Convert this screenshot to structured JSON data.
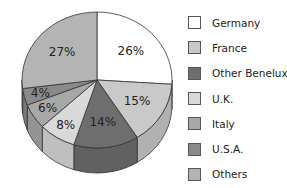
{
  "chart_data": {
    "type": "pie",
    "style": "3d",
    "title": "",
    "categories": [
      "Germany",
      "France",
      "Other Benelux",
      "U.K.",
      "Italy",
      "U.S.A.",
      "Others"
    ],
    "values": [
      26,
      15,
      14,
      8,
      6,
      4,
      27
    ],
    "value_labels": [
      "26%",
      "15%",
      "14%",
      "8%",
      "6%",
      "4%",
      "27%"
    ],
    "colors": [
      "#ffffff",
      "#c9c9c9",
      "#6e6e6e",
      "#d9d9d9",
      "#a8a8a8",
      "#8a8a8a",
      "#b4b4b4"
    ],
    "start_angle_deg": 0,
    "direction": "clockwise",
    "legend_position": "right"
  },
  "legend": {
    "items": [
      {
        "label": "Germany",
        "color": "#ffffff"
      },
      {
        "label": "France",
        "color": "#c9c9c9"
      },
      {
        "label": "Other Benelux",
        "color": "#6e6e6e"
      },
      {
        "label": "U.K.",
        "color": "#d9d9d9"
      },
      {
        "label": "Italy",
        "color": "#a8a8a8"
      },
      {
        "label": "U.S.A.",
        "color": "#8a8a8a"
      },
      {
        "label": "Others",
        "color": "#b4b4b4"
      }
    ]
  }
}
